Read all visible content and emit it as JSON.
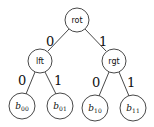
{
  "diagram": {
    "type": "binary-tree",
    "nodes": {
      "root": {
        "label": "rot"
      },
      "left": {
        "label": "lft"
      },
      "right": {
        "label": "rgt"
      },
      "b00": {
        "base": "b",
        "sub": "00"
      },
      "b01": {
        "base": "b",
        "sub": "01"
      },
      "b10": {
        "base": "b",
        "sub": "10"
      },
      "b11": {
        "base": "b",
        "sub": "11"
      }
    },
    "edges": {
      "root_left": "0",
      "root_right": "1",
      "left_b00": "0",
      "left_b01": "1",
      "right_b10": "0",
      "right_b11": "1"
    }
  }
}
